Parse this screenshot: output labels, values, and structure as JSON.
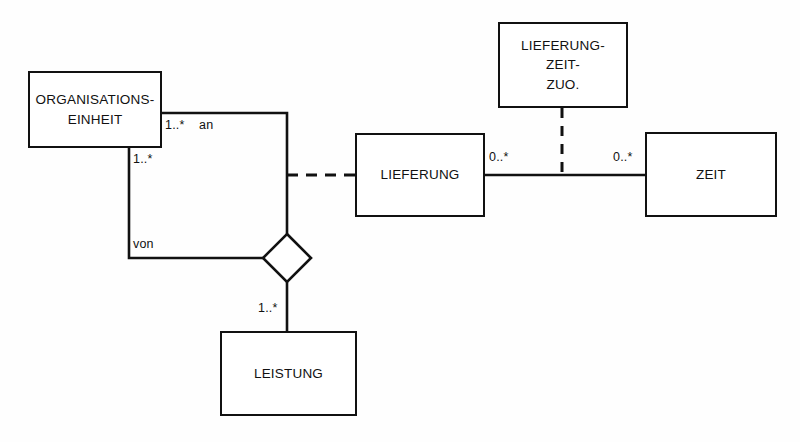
{
  "diagram": {
    "kind": "uml-class-diagram",
    "language": "de",
    "background_color": "#fefefe",
    "line_color": "#111111",
    "box_fill_color": "#ffffff",
    "width": 800,
    "height": 442
  },
  "classes": [
    {
      "id": "organisationseinheit",
      "name": "ORGANISATIONS-\nEINHEIT",
      "x": 28,
      "y": 71,
      "w": 134,
      "h": 77
    },
    {
      "id": "lieferung",
      "name": "LIEFERUNG",
      "x": 355,
      "y": 133,
      "w": 130,
      "h": 84
    },
    {
      "id": "zeit",
      "name": "ZEIT",
      "x": 645,
      "y": 132,
      "w": 132,
      "h": 85
    },
    {
      "id": "lieferung-zeit-zuo",
      "name": "LIEFERUNG-\nZEIT-\nZUO.",
      "x": 498,
      "y": 22,
      "w": 130,
      "h": 86
    },
    {
      "id": "leistung",
      "name": "LEISTUNG",
      "x": 220,
      "y": 331,
      "w": 137,
      "h": 85
    }
  ],
  "associations": [
    {
      "id": "an-assoc",
      "role_label": "an",
      "multiplicity": "1..*",
      "from": "organisationseinheit",
      "to": "aggregation-diamond"
    },
    {
      "id": "von-assoc",
      "role_label": "von",
      "multiplicity": "1..*",
      "from": "organisationseinheit",
      "to": "aggregation-diamond"
    },
    {
      "id": "leistung-assoc",
      "multiplicity": "1..*",
      "from": "aggregation-diamond",
      "to": "leistung"
    },
    {
      "id": "lieferung-zeit-assoc",
      "multiplicity_source": "0..*",
      "multiplicity_target": "0..*",
      "from": "lieferung",
      "to": "zeit"
    },
    {
      "id": "leistung-lieferung-link",
      "style": "dashed",
      "from": "aggregation-diamond",
      "to": "lieferung"
    },
    {
      "id": "association-class-link",
      "style": "dashed",
      "from": "lieferung-zeit-zuo",
      "to": "lieferung-zeit-assoc"
    }
  ],
  "labels": {
    "an_multiplicity": "1..*",
    "an_role": "an",
    "von_multiplicity": "1..*",
    "von_role": "von",
    "leistung_multiplicity": "1..*",
    "lieferung_multiplicity": "0..*",
    "zeit_multiplicity": "0..*"
  },
  "aggregation_diamond": {
    "id": "aggregation-diamond",
    "cx": 287,
    "cy": 258,
    "half": 24,
    "filled": false
  }
}
